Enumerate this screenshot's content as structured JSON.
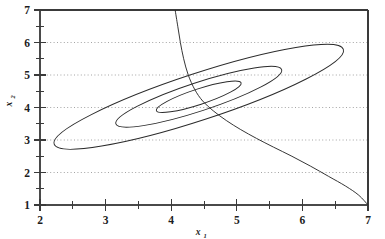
{
  "chart_data": {
    "type": "line",
    "title": "",
    "subtitle": "",
    "xlabel": "x",
    "xlabel_sub": "1",
    "ylabel": "x",
    "ylabel_sub": "2",
    "xlim": [
      2,
      7
    ],
    "ylim": [
      1,
      7
    ],
    "x_ticks": [
      2,
      3,
      4,
      5,
      6,
      7
    ],
    "x_tick_labels": [
      "2",
      "3",
      "4",
      "5",
      "6",
      "7"
    ],
    "x_minor_ticks": [
      2.5,
      3.5,
      4.5,
      5.5,
      6.5
    ],
    "y_ticks": [
      1,
      2,
      3,
      4,
      5,
      6,
      7
    ],
    "y_tick_labels": [
      "1",
      "2",
      "3",
      "4",
      "5",
      "6",
      "7"
    ],
    "y_minor_ticks": [
      1.5,
      2.5,
      3.5,
      4.5,
      5.5,
      6.5
    ],
    "grid": "horizontal-dotted",
    "grid_values": [
      2,
      3,
      4,
      5,
      6
    ],
    "legend": "none",
    "line_color": "#2b2b2b",
    "grid_color": "#9a9a9a",
    "axis_color": "#3a3a3a",
    "background": "#ffffff",
    "series": [
      {
        "name": "contour-outer",
        "shape": "ellipse",
        "center": [
          4.42,
          4.33
        ],
        "semi_major": 2.32,
        "semi_minor": 0.72,
        "rotation_deg": 33.5
      },
      {
        "name": "contour-middle",
        "shape": "ellipse",
        "center": [
          4.42,
          4.33
        ],
        "semi_major": 1.33,
        "semi_minor": 0.44,
        "rotation_deg": 33.5
      },
      {
        "name": "contour-inner",
        "shape": "ellipse",
        "center": [
          4.42,
          4.33
        ],
        "semi_major": 0.68,
        "semi_minor": 0.24,
        "rotation_deg": 33.5
      },
      {
        "name": "constraint-curve",
        "shape": "curve",
        "points": [
          [
            4.06,
            7.0
          ],
          [
            4.1,
            6.5
          ],
          [
            4.14,
            6.0
          ],
          [
            4.19,
            5.5
          ],
          [
            4.26,
            5.0
          ],
          [
            4.36,
            4.55
          ],
          [
            4.48,
            4.2
          ],
          [
            4.64,
            3.9
          ],
          [
            4.84,
            3.6
          ],
          [
            5.06,
            3.32
          ],
          [
            5.3,
            3.05
          ],
          [
            5.56,
            2.78
          ],
          [
            5.84,
            2.5
          ],
          [
            6.12,
            2.2
          ],
          [
            6.4,
            1.88
          ],
          [
            6.66,
            1.58
          ],
          [
            6.86,
            1.3
          ],
          [
            7.0,
            1.0
          ]
        ]
      }
    ]
  },
  "figure": {
    "name": "contour-plot"
  }
}
